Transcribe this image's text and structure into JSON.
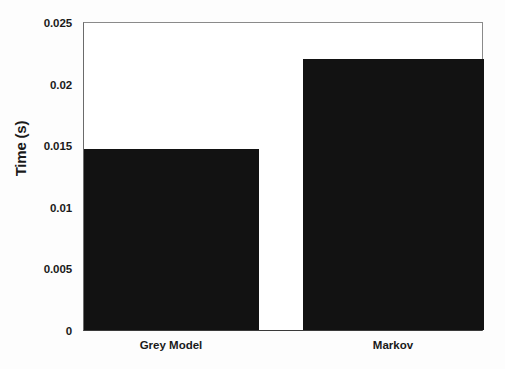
{
  "chart_data": {
    "type": "bar",
    "title": "",
    "xlabel": "",
    "ylabel": "Time (s)",
    "categories": [
      "Grey Model",
      "Markov"
    ],
    "values": [
      0.0147,
      0.0221
    ],
    "series": [
      {
        "name": "Time",
        "values": [
          0.0147,
          0.0221
        ],
        "color": "#121212"
      }
    ],
    "ylim": [
      0,
      0.025
    ],
    "yticks": [
      0,
      0.005,
      0.01,
      0.015,
      0.02,
      0.025
    ],
    "ytick_labels": [
      "0",
      "0.005",
      "0.01",
      "0.015",
      "0.02",
      "0.025"
    ],
    "xtick_labels": [
      "Grey Model",
      "Markov"
    ],
    "grid": false,
    "legend": null,
    "bar_color": "#121212",
    "axis_color": "#4a4a4a",
    "background": "#ffffff"
  },
  "axis": {
    "y_label": "Time (s)",
    "y_ticks": [
      {
        "label": "0.025",
        "value": 0.025
      },
      {
        "label": "0.02",
        "value": 0.02
      },
      {
        "label": "0.015",
        "value": 0.015
      },
      {
        "label": "0.01",
        "value": 0.01
      },
      {
        "label": "0.005",
        "value": 0.005
      },
      {
        "label": "0",
        "value": 0
      }
    ],
    "x_ticks": [
      {
        "label": "Grey Model"
      },
      {
        "label": "Markov"
      }
    ]
  }
}
